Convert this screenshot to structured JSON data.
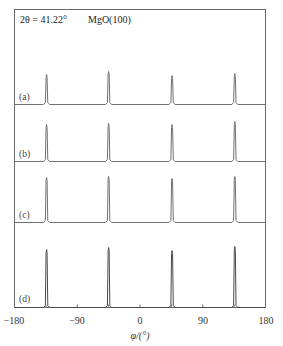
{
  "chart_data": {
    "type": "line",
    "title": "",
    "annotations": [
      "2θ = 41.22°",
      "MgO(100)"
    ],
    "xlabel": "φ/(°)",
    "ylabel": "",
    "xlim": [
      -180,
      180
    ],
    "xticks": [
      -180,
      -90,
      0,
      90,
      180
    ],
    "minor_ticks": [
      -135,
      -45,
      45,
      135
    ],
    "grid": false,
    "legend": "none",
    "series": [
      {
        "name": "(a)",
        "peaks": [
          {
            "x": -134,
            "height": 30
          },
          {
            "x": -45,
            "height": 33
          },
          {
            "x": 46,
            "height": 29
          },
          {
            "x": 136,
            "height": 31
          }
        ],
        "baseline_px": 104
      },
      {
        "name": "(b)",
        "peaks": [
          {
            "x": -134,
            "height": 37
          },
          {
            "x": -45,
            "height": 38
          },
          {
            "x": 46,
            "height": 37
          },
          {
            "x": 136,
            "height": 40
          }
        ],
        "baseline_px": 161
      },
      {
        "name": "(c)",
        "peaks": [
          {
            "x": -134,
            "height": 45
          },
          {
            "x": -45,
            "height": 46
          },
          {
            "x": 46,
            "height": 44
          },
          {
            "x": 136,
            "height": 46
          }
        ],
        "baseline_px": 222
      },
      {
        "name": "(d)",
        "peaks": [
          {
            "x": -134,
            "height": 58
          },
          {
            "x": -45,
            "height": 60
          },
          {
            "x": 46,
            "height": 57
          },
          {
            "x": 136,
            "height": 61
          }
        ],
        "baseline_px": 307
      }
    ]
  },
  "labels": {
    "two_theta": "2θ = 41.22°",
    "sample": "MgO(100)",
    "x_axis": "φ/(°)",
    "tick_neg180": "−180",
    "tick_neg90": "−90",
    "tick_0": "0",
    "tick_90": "90",
    "tick_180": "180",
    "panel_a": "(a)",
    "panel_b": "(b)",
    "panel_c": "(c)",
    "panel_d": "(d)"
  }
}
